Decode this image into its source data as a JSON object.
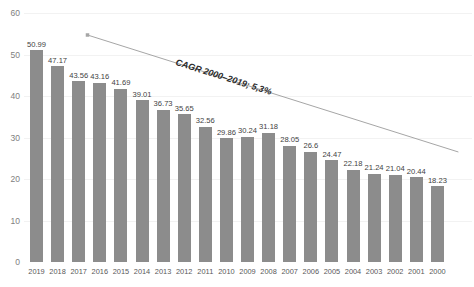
{
  "chart_data": {
    "type": "bar",
    "title": "",
    "xlabel": "",
    "ylabel": "",
    "ylim": [
      0,
      60
    ],
    "yticks": [
      0,
      10,
      20,
      30,
      40,
      50,
      60
    ],
    "grid": true,
    "legend": false,
    "categories": [
      "2019",
      "2018",
      "2017",
      "2016",
      "2015",
      "2014",
      "2013",
      "2012",
      "2011",
      "2010",
      "2009",
      "2008",
      "2007",
      "2006",
      "2005",
      "2004",
      "2003",
      "2002",
      "2001",
      "2000"
    ],
    "values": [
      50.99,
      47.17,
      43.56,
      43.16,
      41.69,
      39.01,
      36.73,
      35.65,
      32.56,
      29.86,
      30.24,
      31.18,
      28.05,
      26.6,
      24.47,
      22.18,
      21.24,
      21.04,
      20.44,
      18.23
    ],
    "data_labels": [
      "50.99",
      "47.17",
      "43.56",
      "43.16",
      "41.69",
      "39.01",
      "36.73",
      "35.65",
      "32.56",
      "29.86",
      "30.24",
      "31.18",
      "28.05",
      "26.6",
      "24.47",
      "22.18",
      "21.24",
      "21.04",
      "20.44",
      "18.23"
    ],
    "annotations": [
      {
        "text": "CAGR 2000–2019; 5,3%",
        "name": "cagr-annotation"
      }
    ],
    "trendline": {
      "from": [
        2000,
        18.23
      ],
      "to": [
        2019,
        50.99
      ]
    },
    "colors": {
      "bar": "#8c8c8c",
      "gridline": "#f2f2f2",
      "trendline": "#a6a6a6",
      "data_label": "#3f3f3f",
      "axis_label": "#595959",
      "annotation": "#2b2b2b"
    }
  }
}
